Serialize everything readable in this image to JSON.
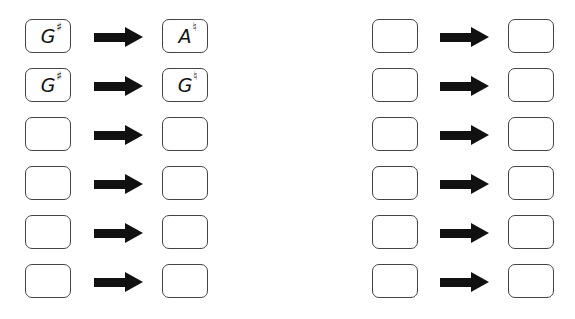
{
  "worksheet": {
    "left_column": [
      {
        "from": {
          "note": "G",
          "accidental": "♯"
        },
        "to": {
          "note": "A",
          "accidental": "♮"
        }
      },
      {
        "from": {
          "note": "G",
          "accidental": "♯"
        },
        "to": {
          "note": "G",
          "accidental": "♮"
        }
      },
      {
        "from": {
          "note": "",
          "accidental": ""
        },
        "to": {
          "note": "",
          "accidental": ""
        }
      },
      {
        "from": {
          "note": "",
          "accidental": ""
        },
        "to": {
          "note": "",
          "accidental": ""
        }
      },
      {
        "from": {
          "note": "",
          "accidental": ""
        },
        "to": {
          "note": "",
          "accidental": ""
        }
      },
      {
        "from": {
          "note": "",
          "accidental": ""
        },
        "to": {
          "note": "",
          "accidental": ""
        }
      }
    ],
    "right_column": [
      {
        "from": {
          "note": "",
          "accidental": ""
        },
        "to": {
          "note": "",
          "accidental": ""
        }
      },
      {
        "from": {
          "note": "",
          "accidental": ""
        },
        "to": {
          "note": "",
          "accidental": ""
        }
      },
      {
        "from": {
          "note": "",
          "accidental": ""
        },
        "to": {
          "note": "",
          "accidental": ""
        }
      },
      {
        "from": {
          "note": "",
          "accidental": ""
        },
        "to": {
          "note": "",
          "accidental": ""
        }
      },
      {
        "from": {
          "note": "",
          "accidental": ""
        },
        "to": {
          "note": "",
          "accidental": ""
        }
      },
      {
        "from": {
          "note": "",
          "accidental": ""
        },
        "to": {
          "note": "",
          "accidental": ""
        }
      }
    ],
    "arrow_icon": "right-arrow-icon",
    "colors": {
      "border": "#444444",
      "arrow": "#111111",
      "background": "#ffffff"
    }
  }
}
